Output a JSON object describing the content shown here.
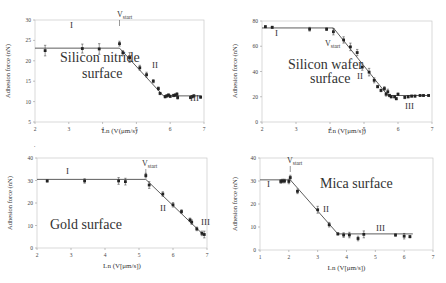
{
  "chart_data": [
    {
      "type": "scatter",
      "title": "",
      "annotation": "Silicon nitride surface",
      "annotation_lines": [
        "Silicon nitride",
        "surface"
      ],
      "xlabel": "Ln (V(μm/s)",
      "ylabel": "Adhesion force (nN)",
      "xlim": [
        2,
        7
      ],
      "ylim": [
        5,
        30
      ],
      "xticks": [
        2,
        3,
        4,
        5,
        6,
        7
      ],
      "yticks": [
        5,
        10,
        15,
        20,
        25,
        30
      ],
      "grid": false,
      "regions": [
        "I",
        "II",
        "III"
      ],
      "vstart_label": "V",
      "vstart_sub": "start",
      "vstart_x": 4.5,
      "fit_line": [
        [
          2.0,
          23.1
        ],
        [
          4.5,
          23.1
        ],
        [
          5.8,
          11.4
        ],
        [
          6.9,
          11.4
        ]
      ],
      "points": [
        [
          2.3,
          22.5
        ],
        [
          3.4,
          23.0
        ],
        [
          3.9,
          22.9
        ],
        [
          4.5,
          24.2
        ],
        [
          4.6,
          22.0
        ],
        [
          4.8,
          20.8
        ],
        [
          5.1,
          18.3
        ],
        [
          5.3,
          16.6
        ],
        [
          5.5,
          15.0
        ],
        [
          5.65,
          13.2
        ],
        [
          5.7,
          12.0
        ],
        [
          5.85,
          11.2
        ],
        [
          5.9,
          11.4
        ],
        [
          5.95,
          11.6
        ],
        [
          6.0,
          11.3
        ],
        [
          6.1,
          11.5
        ],
        [
          6.15,
          11.6
        ],
        [
          6.2,
          11.8
        ],
        [
          6.22,
          11.0
        ],
        [
          6.6,
          11.0
        ],
        [
          6.65,
          11.2
        ],
        [
          6.7,
          11.4
        ],
        [
          6.9,
          11.1
        ]
      ],
      "error_bars": [
        1.3,
        1.1,
        1.3,
        0.6,
        0.5,
        1.2,
        0.6,
        0.6,
        0.4,
        0.4,
        0.3,
        0.3,
        0.3,
        0.3,
        0.3,
        0.3,
        0.3,
        0.4,
        0.4,
        0.3,
        0.3,
        0.3,
        0.3
      ]
    },
    {
      "type": "scatter",
      "title": "",
      "annotation": "Silicon wafer surface",
      "annotation_lines": [
        "Silicon wafer",
        "surface"
      ],
      "xlabel": "Ln (V[μm/s])",
      "ylabel": "Adhesion force (nN)",
      "xlim": [
        2,
        7
      ],
      "ylim": [
        0,
        80
      ],
      "xticks": [
        2,
        3,
        4,
        5,
        6,
        7
      ],
      "yticks": [
        0,
        20,
        40,
        60,
        80
      ],
      "grid": false,
      "regions": [
        "I",
        "II",
        "III"
      ],
      "vstart_label": "V",
      "vstart_sub": "start",
      "vstart_x": 4.1,
      "fit_line": [
        [
          2.0,
          74.5
        ],
        [
          4.1,
          74.5
        ],
        [
          5.7,
          21.0
        ],
        [
          6.9,
          21.0
        ]
      ],
      "points": [
        [
          2.1,
          75.5
        ],
        [
          2.3,
          75.0
        ],
        [
          3.4,
          73.5
        ],
        [
          3.9,
          73.5
        ],
        [
          4.1,
          71.5
        ],
        [
          4.4,
          65.0
        ],
        [
          4.6,
          59.5
        ],
        [
          4.8,
          55.0
        ],
        [
          4.95,
          43.5
        ],
        [
          5.15,
          39.5
        ],
        [
          5.3,
          33.0
        ],
        [
          5.4,
          28.0
        ],
        [
          5.5,
          25.0
        ],
        [
          5.6,
          26.5
        ],
        [
          5.65,
          22.0
        ],
        [
          5.7,
          24.0
        ],
        [
          5.75,
          21.0
        ],
        [
          5.8,
          20.0
        ],
        [
          5.9,
          20.0
        ],
        [
          5.95,
          18.5
        ],
        [
          6.0,
          22.0
        ],
        [
          6.2,
          19.5
        ],
        [
          6.3,
          20.0
        ],
        [
          6.4,
          20.5
        ],
        [
          6.5,
          20.5
        ],
        [
          6.65,
          21.0
        ],
        [
          6.75,
          21.0
        ],
        [
          6.9,
          21.0
        ]
      ],
      "error_bars": [
        0.8,
        0.8,
        1.5,
        1.0,
        2.5,
        2.5,
        3.0,
        2.5,
        2.5,
        3.0,
        2.0,
        1.0,
        1.0,
        1.5,
        1.5,
        2.0,
        1.0,
        1.0,
        1.0,
        1.0,
        1.0,
        1.0,
        1.0,
        0.8,
        0.8,
        0.8,
        0.8,
        0.8
      ]
    },
    {
      "type": "scatter",
      "title": "",
      "annotation": "Gold surface",
      "annotation_lines": [
        "Gold surface"
      ],
      "xlabel": "Ln (V[μm/s])",
      "ylabel": "Adhesion force (nN)",
      "xlim": [
        2,
        7
      ],
      "ylim": [
        0,
        40
      ],
      "xticks": [
        2,
        3,
        4,
        5,
        6,
        7
      ],
      "yticks": [
        0,
        10,
        20,
        30,
        40
      ],
      "grid": false,
      "regions": [
        "I",
        "II",
        "III"
      ],
      "vstart_label": "V",
      "vstart_sub": "start",
      "vstart_x": 5.2,
      "fit_line": [
        [
          2.0,
          30.5
        ],
        [
          5.2,
          30.5
        ],
        [
          6.9,
          5.8
        ]
      ],
      "points": [
        [
          2.3,
          29.8
        ],
        [
          3.4,
          29.8
        ],
        [
          4.4,
          29.8
        ],
        [
          4.6,
          29.5
        ],
        [
          5.2,
          32.2
        ],
        [
          5.3,
          28.0
        ],
        [
          5.7,
          24.0
        ],
        [
          6.0,
          19.2
        ],
        [
          6.25,
          16.2
        ],
        [
          6.5,
          12.5
        ],
        [
          6.55,
          11.5
        ],
        [
          6.7,
          8.5
        ],
        [
          6.85,
          6.5
        ],
        [
          6.92,
          6.0
        ]
      ],
      "error_bars": [
        0.5,
        1.0,
        1.5,
        1.5,
        1.0,
        1.5,
        1.0,
        1.0,
        0.8,
        0.8,
        1.0,
        0.8,
        1.0,
        1.5
      ]
    },
    {
      "type": "scatter",
      "title": "",
      "annotation": "Mica surface",
      "annotation_lines": [
        "Mica surface"
      ],
      "xlabel": "Ln (V[μm/s])",
      "ylabel": "Adhesion force (nN)",
      "xlim": [
        1,
        7
      ],
      "ylim": [
        0,
        40
      ],
      "xticks": [
        1,
        2,
        3,
        4,
        5,
        6,
        7
      ],
      "yticks": [
        0,
        10,
        20,
        30,
        40
      ],
      "grid": false,
      "regions": [
        "I",
        "II",
        "III"
      ],
      "vstart_label": "V",
      "vstart_sub": "start",
      "vstart_x": 2.05,
      "fit_line": [
        [
          1.0,
          30.5
        ],
        [
          2.05,
          30.5
        ],
        [
          3.7,
          7.0
        ],
        [
          6.3,
          7.0
        ]
      ],
      "points": [
        [
          1.72,
          29.8
        ],
        [
          1.78,
          30.0
        ],
        [
          1.85,
          30.0
        ],
        [
          2.0,
          29.8
        ],
        [
          2.05,
          31.5
        ],
        [
          2.3,
          25.5
        ],
        [
          3.0,
          17.5
        ],
        [
          3.4,
          11.0
        ],
        [
          3.7,
          7.0
        ],
        [
          3.9,
          6.5
        ],
        [
          4.1,
          6.5
        ],
        [
          4.4,
          5.0
        ],
        [
          4.6,
          6.8
        ],
        [
          5.7,
          6.5
        ],
        [
          6.0,
          6.0
        ],
        [
          6.2,
          5.8
        ]
      ],
      "error_bars": [
        0.8,
        0.8,
        0.8,
        1.0,
        1.0,
        1.0,
        1.5,
        1.0,
        0.5,
        1.0,
        1.2,
        1.0,
        1.5,
        0.5,
        1.2,
        0.5
      ]
    }
  ]
}
